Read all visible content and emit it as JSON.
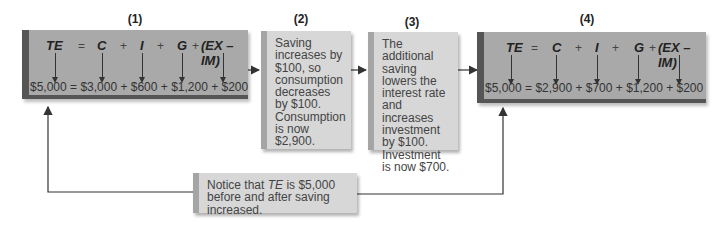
{
  "steps": [
    {
      "label": "(1)",
      "equation": {
        "te": "TE",
        "eq": "=",
        "c": "C",
        "plus1": "+",
        "i": "I",
        "plus2": "+",
        "g": "G",
        "plus3": "+",
        "nx": "(EX – IM)"
      },
      "values": "$5,000 = $3,000 + $600 + $1,200 + $200"
    },
    {
      "label": "(2)",
      "text": "Saving increases by $100, so consumption decreases by $100. Consumption is now $2,900."
    },
    {
      "label": "(3)",
      "text": "The additional saving lowers the interest rate and increases investment by $100. Investment is now $700."
    },
    {
      "label": "(4)",
      "equation": {
        "te": "TE",
        "eq": "=",
        "c": "C",
        "plus1": "+",
        "i": "I",
        "plus2": "+",
        "g": "G",
        "plus3": "+",
        "nx": "(EX – IM)"
      },
      "values": "$5,000 = $2,900 + $700 + $1,200 + $200"
    }
  ],
  "note": {
    "prefix": "Notice that ",
    "em": "TE",
    "suffix": " is $5,000 before and after saving increased."
  },
  "colors": {
    "dark_box": "#a9a9a9",
    "light_box": "#d7d7d7",
    "border_dark": "#555555",
    "arrow": "#333333"
  }
}
